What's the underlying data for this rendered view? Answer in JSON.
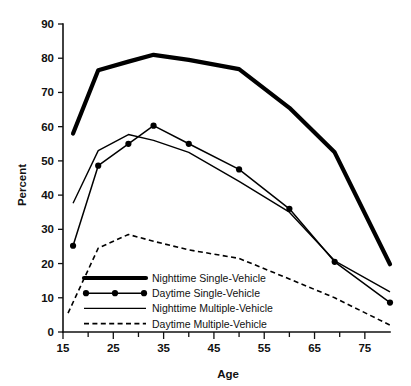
{
  "chart_data": {
    "type": "line",
    "title": "",
    "xlabel": "Age",
    "ylabel": "Percent",
    "xlim": [
      15,
      80
    ],
    "ylim": [
      0,
      90
    ],
    "grid": false,
    "legend_position": "inside-bottom-left",
    "x_ticks_major": [
      15,
      25,
      35,
      45,
      55,
      65,
      75
    ],
    "x_ticks_minor": [
      20,
      30,
      40,
      50,
      60,
      70
    ],
    "y_ticks": [
      0,
      10,
      20,
      30,
      40,
      50,
      60,
      70,
      80,
      90
    ],
    "series": [
      {
        "name": "Nighttime Single-Vehicle",
        "style": "thick",
        "markers": false,
        "x": [
          17,
          22,
          28,
          33,
          40,
          50,
          60,
          69,
          80
        ],
        "values": [
          58,
          76.5,
          79,
          81,
          79.5,
          76.8,
          65.5,
          52.5,
          19.8
        ]
      },
      {
        "name": "Daytime Single-Vehicle",
        "style": "marked",
        "markers": true,
        "x": [
          17,
          22,
          28,
          33,
          40,
          50,
          60,
          69,
          80
        ],
        "values": [
          25.2,
          48.6,
          55,
          60.3,
          55,
          47.5,
          36,
          20.5,
          8.6
        ]
      },
      {
        "name": "Nighttime Multiple-Vehicle",
        "style": "thin",
        "markers": false,
        "x": [
          17,
          22,
          28,
          33,
          40,
          50,
          60,
          69,
          80
        ],
        "values": [
          37.6,
          53,
          57.7,
          56,
          52.5,
          44,
          35,
          20.8,
          11.7
        ]
      },
      {
        "name": "Daytime Multiple-Vehicle",
        "style": "dashed",
        "markers": false,
        "x": [
          16,
          22,
          28,
          33,
          40,
          50,
          60,
          69,
          80
        ],
        "values": [
          5.5,
          24.5,
          28.5,
          26.5,
          24,
          21.5,
          15.5,
          10,
          2
        ]
      }
    ],
    "legend": [
      {
        "label": "Nighttime Single-Vehicle",
        "style": "thick"
      },
      {
        "label": "Daytime Single-Vehicle",
        "style": "marked"
      },
      {
        "label": "Nighttime Multiple-Vehicle",
        "style": "thin"
      },
      {
        "label": "Daytime Multiple-Vehicle",
        "style": "dashed"
      }
    ]
  }
}
